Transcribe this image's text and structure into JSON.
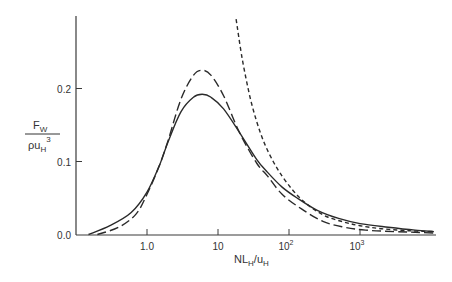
{
  "chart_data": {
    "type": "line",
    "title": "",
    "xlabel": "NL_H/u_H",
    "ylabel": "F_W / (ρ u_H^3)",
    "xscale": "log",
    "xlim": [
      0.1,
      12000
    ],
    "ylim": [
      0.0,
      0.3
    ],
    "grid": false,
    "legend": null,
    "x_ticks": [
      {
        "value": 1,
        "label": "1.0"
      },
      {
        "value": 10,
        "label": "10"
      },
      {
        "value": 100,
        "label": "10",
        "sup": "2"
      },
      {
        "value": 1000,
        "label": "10",
        "sup": "3"
      }
    ],
    "y_ticks": [
      {
        "value": 0.0,
        "label": "0.0"
      },
      {
        "value": 0.1,
        "label": "0.1"
      },
      {
        "value": 0.2,
        "label": "0.2"
      }
    ],
    "series": [
      {
        "name": "solid",
        "style": "solid",
        "x": [
          0.15,
          0.3,
          0.6,
          1.0,
          1.5,
          2.0,
          3.0,
          4.5,
          6.0,
          8.0,
          12,
          20,
          35,
          50,
          80,
          130,
          250,
          500,
          1000,
          2500,
          6000,
          11000
        ],
        "y": [
          0.0,
          0.012,
          0.03,
          0.058,
          0.095,
          0.128,
          0.168,
          0.188,
          0.192,
          0.188,
          0.172,
          0.14,
          0.103,
          0.085,
          0.065,
          0.05,
          0.033,
          0.022,
          0.015,
          0.01,
          0.006,
          0.004
        ]
      },
      {
        "name": "long-dashed",
        "style": "long-dash",
        "x": [
          0.2,
          0.4,
          0.7,
          1.0,
          1.5,
          2.0,
          3.0,
          4.5,
          6.0,
          8.0,
          12,
          20,
          35,
          50,
          80,
          150,
          300,
          600,
          1200,
          3000,
          6000,
          11000
        ],
        "y": [
          0.0,
          0.01,
          0.028,
          0.055,
          0.095,
          0.13,
          0.185,
          0.218,
          0.225,
          0.218,
          0.19,
          0.14,
          0.098,
          0.08,
          0.055,
          0.035,
          0.018,
          0.01,
          0.006,
          0.004,
          0.003,
          0.002
        ]
      },
      {
        "name": "short-dashed",
        "style": "short-dash",
        "x": [
          18,
          22,
          28,
          35,
          45,
          60,
          80,
          110,
          150,
          220,
          350,
          600,
          1000,
          2000,
          5000,
          11000
        ],
        "y": [
          0.295,
          0.24,
          0.19,
          0.155,
          0.125,
          0.1,
          0.08,
          0.062,
          0.048,
          0.035,
          0.024,
          0.017,
          0.012,
          0.008,
          0.005,
          0.004
        ]
      }
    ]
  },
  "labels": {
    "y_numerator": "F",
    "y_numerator_sub": "W",
    "y_denominator": "ρu",
    "y_denominator_sub": "H",
    "y_denominator_sup": "3",
    "x_main": "NL",
    "x_sub1": "H",
    "x_mid": "/u",
    "x_sub2": "H"
  }
}
